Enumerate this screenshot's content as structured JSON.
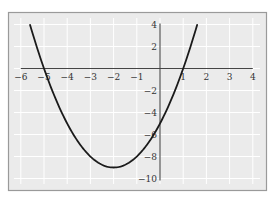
{
  "chart_data": {
    "type": "line",
    "title": "",
    "xlabel": "",
    "ylabel": "",
    "function": "y = x^2 + 4x - 5",
    "xlim": [
      -6,
      4
    ],
    "ylim": [
      -10,
      4
    ],
    "grid": true,
    "legend": null,
    "x_ticks": [
      {
        "value": -6,
        "label": "−6"
      },
      {
        "value": -5,
        "label": "−5"
      },
      {
        "value": -4,
        "label": "−4"
      },
      {
        "value": -3,
        "label": "−3"
      },
      {
        "value": -2,
        "label": "−2"
      },
      {
        "value": -1,
        "label": "−1"
      },
      {
        "value": 1,
        "label": "1"
      },
      {
        "value": 2,
        "label": "2"
      },
      {
        "value": 3,
        "label": "3"
      },
      {
        "value": 4,
        "label": "4"
      }
    ],
    "y_ticks": [
      {
        "value": 4,
        "label": "4"
      },
      {
        "value": 2,
        "label": "2"
      },
      {
        "value": -2,
        "label": "−2"
      },
      {
        "value": -4,
        "label": "−4"
      },
      {
        "value": -6,
        "label": "−6"
      },
      {
        "value": -8,
        "label": "−8"
      },
      {
        "value": -10,
        "label": "−10"
      }
    ],
    "series": [
      {
        "name": "parabola",
        "x": [
          -5.6,
          -5,
          -4.5,
          -4,
          -3.5,
          -3,
          -2.5,
          -2,
          -1.5,
          -1,
          -0.5,
          0,
          0.5,
          1,
          1.5,
          1.6
        ],
        "y": [
          3.96,
          0,
          -2.75,
          -5,
          -6.75,
          -8,
          -8.75,
          -9,
          -8.75,
          -8,
          -6.75,
          -5,
          -2.75,
          0,
          3.25,
          3.96
        ]
      }
    ],
    "key_points": {
      "vertex": [
        -2,
        -9
      ],
      "x_intercepts": [
        -5,
        1
      ],
      "y_intercept": [
        0,
        -5
      ]
    }
  },
  "colors": {
    "background": "#ebebeb",
    "grid": "#ffffff",
    "frame": "#9a9a9a",
    "axis": "#444444",
    "curve": "#1a1a1a"
  }
}
